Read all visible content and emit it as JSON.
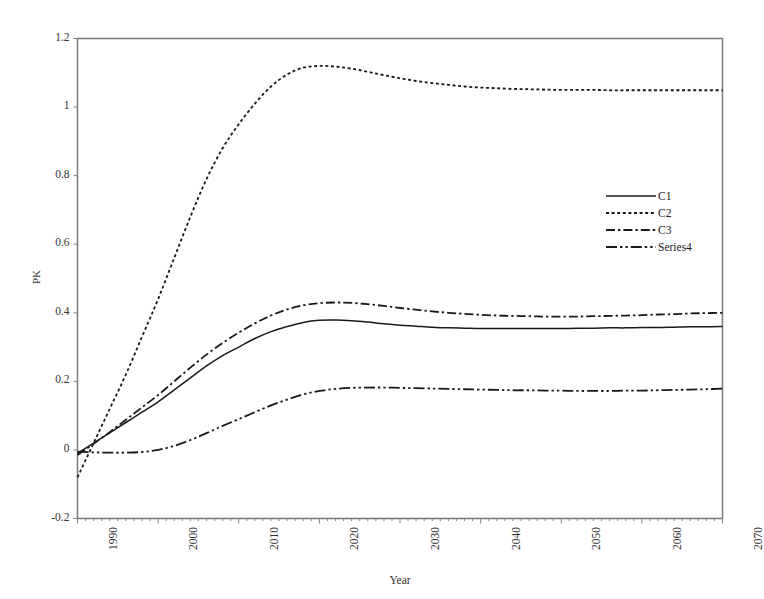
{
  "chart_data": {
    "type": "line",
    "title": "",
    "xlabel": "Year",
    "ylabel": "PK",
    "xlim": [
      1990,
      2070
    ],
    "ylim": [
      -0.2,
      1.2
    ],
    "grid": false,
    "legend_position": "inside-right-upper",
    "xticks": [
      "1990",
      "2000",
      "2010",
      "2020",
      "2030",
      "2040",
      "2050",
      "2060",
      "2070"
    ],
    "yticks": [
      "-0.2",
      "0",
      "0.2",
      "0.4",
      "0.6",
      "0.8",
      "1",
      "1.2"
    ],
    "x": [
      1990,
      1992,
      1994,
      1996,
      1998,
      2000,
      2002,
      2004,
      2006,
      2008,
      2010,
      2012,
      2014,
      2016,
      2018,
      2020,
      2022,
      2024,
      2026,
      2028,
      2030,
      2032,
      2034,
      2036,
      2038,
      2040,
      2042,
      2044,
      2046,
      2048,
      2050,
      2052,
      2054,
      2056,
      2058,
      2060,
      2062,
      2064,
      2066,
      2068,
      2070
    ],
    "series": [
      {
        "name": "C1",
        "style": "solid",
        "color": "#1a1a1a",
        "values": [
          -0.01,
          0.02,
          0.05,
          0.08,
          0.11,
          0.14,
          0.175,
          0.21,
          0.245,
          0.275,
          0.3,
          0.325,
          0.345,
          0.36,
          0.372,
          0.378,
          0.379,
          0.377,
          0.373,
          0.368,
          0.364,
          0.361,
          0.358,
          0.356,
          0.355,
          0.354,
          0.354,
          0.354,
          0.354,
          0.354,
          0.354,
          0.355,
          0.355,
          0.356,
          0.356,
          0.357,
          0.357,
          0.358,
          0.359,
          0.359,
          0.36
        ]
      },
      {
        "name": "C2",
        "style": "dotted",
        "color": "#1a1a1a",
        "values": [
          -0.08,
          0.02,
          0.12,
          0.22,
          0.33,
          0.44,
          0.56,
          0.68,
          0.79,
          0.88,
          0.95,
          1.01,
          1.06,
          1.095,
          1.115,
          1.12,
          1.118,
          1.112,
          1.103,
          1.093,
          1.084,
          1.076,
          1.07,
          1.065,
          1.06,
          1.057,
          1.055,
          1.053,
          1.052,
          1.051,
          1.05,
          1.05,
          1.05,
          1.049,
          1.049,
          1.049,
          1.049,
          1.049,
          1.049,
          1.049,
          1.049
        ]
      },
      {
        "name": "C3",
        "style": "dashdot",
        "color": "#1a1a1a",
        "values": [
          -0.015,
          0.018,
          0.052,
          0.088,
          0.124,
          0.16,
          0.2,
          0.24,
          0.278,
          0.312,
          0.342,
          0.369,
          0.392,
          0.41,
          0.422,
          0.428,
          0.43,
          0.429,
          0.425,
          0.42,
          0.414,
          0.409,
          0.404,
          0.4,
          0.397,
          0.394,
          0.392,
          0.391,
          0.39,
          0.389,
          0.389,
          0.389,
          0.39,
          0.391,
          0.392,
          0.393,
          0.395,
          0.396,
          0.398,
          0.399,
          0.4
        ]
      },
      {
        "name": "Series4",
        "style": "dashdotdot",
        "color": "#1a1a1a",
        "values": [
          -0.005,
          -0.007,
          -0.008,
          -0.008,
          -0.006,
          0.0,
          0.012,
          0.029,
          0.049,
          0.07,
          0.09,
          0.11,
          0.13,
          0.147,
          0.162,
          0.172,
          0.178,
          0.181,
          0.182,
          0.182,
          0.181,
          0.18,
          0.179,
          0.178,
          0.177,
          0.176,
          0.175,
          0.174,
          0.174,
          0.173,
          0.173,
          0.172,
          0.172,
          0.172,
          0.173,
          0.173,
          0.174,
          0.175,
          0.176,
          0.177,
          0.179
        ]
      }
    ],
    "legend_entries": [
      "C1",
      "C2",
      "C3",
      "Series4"
    ]
  },
  "axes": {
    "y_title": "PK",
    "x_title": "Year"
  },
  "colors": {
    "frame": "#808080",
    "line": "#1a1a1a",
    "tick_text": "#333333",
    "background": "#ffffff"
  }
}
